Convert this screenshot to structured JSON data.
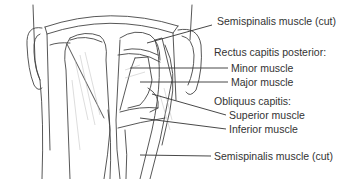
{
  "diagram": {
    "labels": [
      {
        "id": "semispinalis-top",
        "text": "Semispinalis muscle (cut)",
        "x": 217,
        "y": 21
      },
      {
        "id": "rectus-heading",
        "text": "Rectus capitis posterior:",
        "x": 214,
        "y": 52
      },
      {
        "id": "minor",
        "text": "Minor muscle",
        "x": 231,
        "y": 64
      },
      {
        "id": "major",
        "text": "Major muscle",
        "x": 231,
        "y": 78
      },
      {
        "id": "obliquus-heading",
        "text": "Obliquus capitis:",
        "x": 214,
        "y": 97
      },
      {
        "id": "superior",
        "text": "Superior muscle",
        "x": 229,
        "y": 110
      },
      {
        "id": "inferior",
        "text": "Inferior muscle",
        "x": 229,
        "y": 124
      },
      {
        "id": "semispinalis-bottom",
        "text": "Semispinalis muscle (cut)",
        "x": 214,
        "y": 152
      }
    ],
    "colors": {
      "line": "#333333",
      "shade": "#e6e6e6",
      "text": "#333333"
    }
  }
}
